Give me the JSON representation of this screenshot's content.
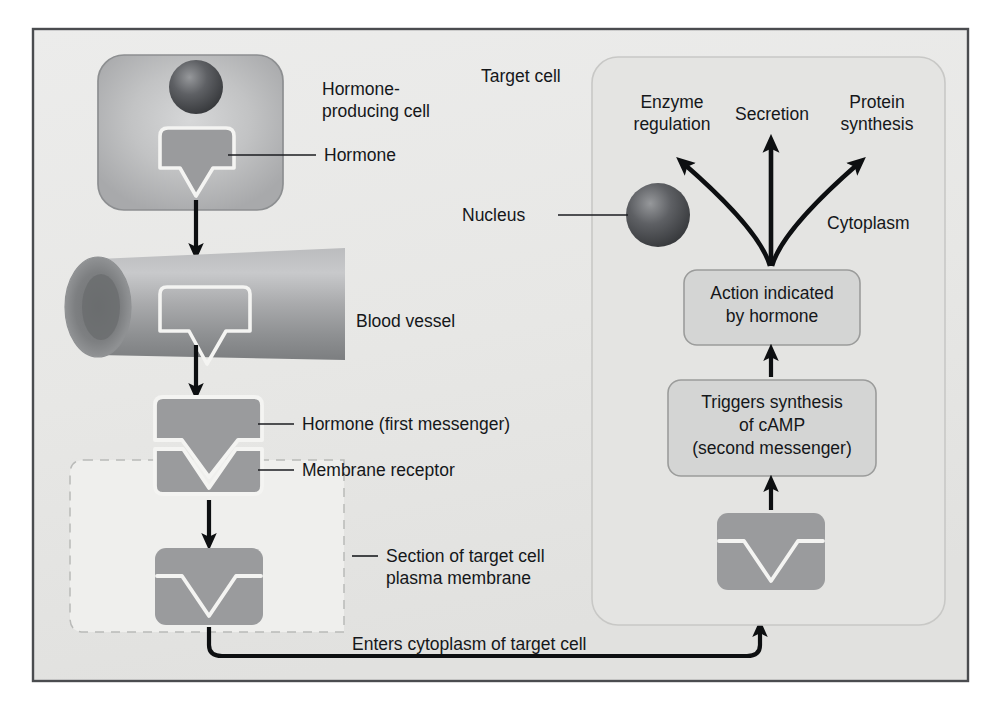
{
  "figure": {
    "frame_border_color": "#4a4c4f",
    "frame_background": "#e8e8e6",
    "page_background": "#ffffff"
  },
  "palette": {
    "cell_fill": "#b9babb",
    "cell_border": "#8d8f91",
    "hormone_fill": "#9a9b9d",
    "hormone_outline": "#f4f4f2",
    "nucleus_dark": "#3d3f42",
    "nucleus_light": "#8e9093",
    "vessel_fill": "#a9aaac",
    "vessel_dark": "#76787a",
    "panel_fill": "#e2e2e0",
    "panel_border": "#c6c6c4",
    "box_fill": "#d2d3d2",
    "box_border": "#9a9b9a",
    "membrane_fill": "#efefed",
    "membrane_border": "#b7b8b6",
    "arrow_color": "#0d0f11",
    "text_color": "#15171a"
  },
  "left_column": {
    "producing_cell": {
      "label": "Hormone-\nproducing cell",
      "label_line1": "Hormone-",
      "label_line2": "producing cell",
      "nucleus_name": "cell-nucleus"
    },
    "hormone_label": "Hormone",
    "blood_vessel_label": "Blood vessel",
    "hormone_first_messenger_label": "Hormone (first messenger)",
    "membrane_receptor_label": "Membrane receptor",
    "membrane_section_label_line1": "Section of target cell",
    "membrane_section_label_line2": "plasma membrane",
    "enters_cytoplasm_label": "Enters cytoplasm of target cell"
  },
  "target_cell": {
    "title": "Target cell",
    "cytoplasm_label": "Cytoplasm",
    "nucleus_label": "Nucleus",
    "outcomes": [
      {
        "id": "enzyme-regulation",
        "line1": "Enzyme",
        "line2": "regulation"
      },
      {
        "id": "secretion",
        "line1": "Secretion",
        "line2": ""
      },
      {
        "id": "protein-synthesis",
        "line1": "Protein",
        "line2": "synthesis"
      }
    ],
    "action_box": {
      "line1": "Action indicated",
      "line2": "by hormone"
    },
    "camp_box": {
      "line1": "Triggers synthesis",
      "line2": "of cAMP",
      "line3": "(second messenger)"
    }
  }
}
